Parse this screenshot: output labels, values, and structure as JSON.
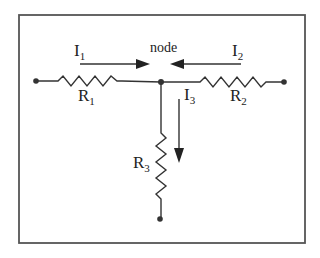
{
  "diagram": {
    "type": "circuit",
    "node_label": "node",
    "colors": {
      "ink": "#333333",
      "frame": "#555555",
      "background": "#ffffff"
    },
    "currents": [
      {
        "id": "I1",
        "main": "I",
        "sub": "1",
        "direction": "right",
        "into_node": true
      },
      {
        "id": "I2",
        "main": "I",
        "sub": "2",
        "direction": "left",
        "into_node": true
      },
      {
        "id": "I3",
        "main": "I",
        "sub": "3",
        "direction": "down",
        "into_node": false
      }
    ],
    "resistors": [
      {
        "id": "R1",
        "main": "R",
        "sub": "1",
        "orientation": "horizontal",
        "branch": "left"
      },
      {
        "id": "R2",
        "main": "R",
        "sub": "2",
        "orientation": "horizontal",
        "branch": "right"
      },
      {
        "id": "R3",
        "main": "R",
        "sub": "3",
        "orientation": "vertical",
        "branch": "bottom"
      }
    ],
    "terminals": [
      "left",
      "right",
      "bottom"
    ]
  }
}
